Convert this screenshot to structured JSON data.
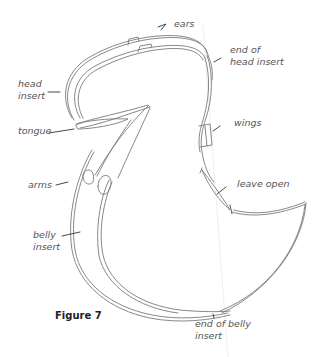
{
  "figure": {
    "caption": "Figure 7",
    "stroke_color": "#6b6b6b"
  },
  "labels": {
    "ears": "ears",
    "end_of_head_insert": "end of\nhead insert",
    "head_insert": "head\ninsert",
    "tongue": "tongue",
    "wings": "wings",
    "arms": "arms",
    "leave_open": "leave open",
    "belly_insert": "belly\ninsert",
    "end_of_belly_insert": "end of belly\ninsert"
  }
}
